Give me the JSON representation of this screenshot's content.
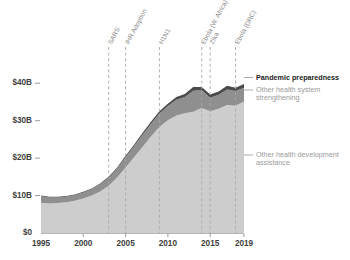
{
  "chart_data": {
    "type": "area",
    "title": "",
    "subtitle": "",
    "xlabel": "",
    "ylabel": "",
    "xlim": [
      1995,
      2019
    ],
    "ylim": [
      0,
      43
    ],
    "grid": false,
    "legend_position": "right-inline",
    "y_tick_labels": [
      "$0",
      "$10B",
      "$20B",
      "$30B",
      "$40B"
    ],
    "y_tick_values": [
      0,
      10,
      20,
      30,
      40
    ],
    "x_tick_labels": [
      "1995",
      "2000",
      "2005",
      "2010",
      "2015",
      "2019"
    ],
    "x_tick_values": [
      1995,
      2000,
      2005,
      2010,
      2015,
      2019
    ],
    "x": [
      1995,
      1996,
      1997,
      1998,
      1999,
      2000,
      2001,
      2002,
      2003,
      2004,
      2005,
      2006,
      2007,
      2008,
      2009,
      2010,
      2011,
      2012,
      2013,
      2014,
      2015,
      2016,
      2017,
      2018,
      2019
    ],
    "series": [
      {
        "name": "Other health development assistance",
        "color": "#cdcdcd",
        "values": [
          8.1,
          7.9,
          8.0,
          8.2,
          8.6,
          9.2,
          10.0,
          11.1,
          12.6,
          14.8,
          17.5,
          20.2,
          23.0,
          25.8,
          28.3,
          30.1,
          31.4,
          32.0,
          32.4,
          33.4,
          32.5,
          33.2,
          34.2,
          34.0,
          35.1
        ]
      },
      {
        "name": "Other health system strengthening",
        "color": "#8f8f8f",
        "values": [
          1.7,
          1.6,
          1.5,
          1.5,
          1.5,
          1.6,
          1.7,
          1.9,
          2.1,
          2.4,
          2.7,
          3.0,
          3.2,
          3.4,
          3.6,
          3.8,
          4.2,
          4.3,
          5.6,
          4.8,
          3.6,
          3.7,
          4.1,
          3.9,
          3.7
        ]
      },
      {
        "name": "Pandemic preparedness",
        "color": "#4a4a4a",
        "values": [
          0.2,
          0.2,
          0.2,
          0.2,
          0.2,
          0.2,
          0.2,
          0.2,
          0.3,
          0.3,
          0.4,
          0.4,
          0.5,
          0.5,
          0.6,
          0.6,
          0.7,
          0.8,
          1.0,
          0.8,
          0.9,
          0.9,
          1.0,
          0.9,
          1.0
        ]
      }
    ],
    "annotations": [
      {
        "label": "SARS",
        "year": 2003
      },
      {
        "label": "IHR Adoption",
        "year": 2005
      },
      {
        "label": "H1N1",
        "year": 2009
      },
      {
        "label": "Ebola (W. Africa)",
        "year": 2014
      },
      {
        "label": "Zika",
        "year": 2015
      },
      {
        "label": "Ebola (DRC)",
        "year": 2018
      }
    ],
    "legend": [
      {
        "label": "Pandemic preparedness",
        "color": "#1c1c1c",
        "emphasis": "bold"
      },
      {
        "label": "Other health system",
        "label2": "strengthening",
        "color": "#9a9a9a",
        "emphasis": "normal"
      },
      {
        "label": "Other health development",
        "label2": "assistance",
        "color": "#9a9a9a",
        "emphasis": "normal"
      }
    ]
  },
  "colors": {
    "band_light": "#cdcdcd",
    "band_mid": "#8f8f8f",
    "band_dark": "#4a4a4a",
    "axis": "#b5b5b5",
    "event_line": "#a8a8a8",
    "background": "#ffffff"
  }
}
